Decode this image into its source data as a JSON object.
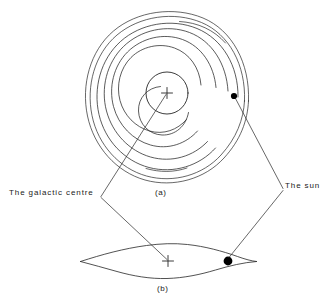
{
  "figure": {
    "type": "astronomy-schematic-diagram",
    "labels": {
      "galactic_centre": "The galactic centre",
      "the_sun": "The sun"
    },
    "captions": {
      "panel_a": "(a)",
      "panel_b": "(b)"
    },
    "colors": {
      "ink": "#262626",
      "background": "#ffffff",
      "marker_fill": "#000000"
    },
    "panel_a": {
      "view": "face-on spiral galaxy",
      "centre_marker": "plus-cross",
      "centre_xy": [
        167,
        93
      ],
      "sun_marker": "filled-dot",
      "sun_xy": [
        234,
        96
      ],
      "bulge_radius": 21,
      "spiral_arm_count": 4,
      "outer_ring_count": 2
    },
    "panel_b": {
      "view": "edge-on galactic disk",
      "centre_marker": "plus-cross",
      "centre_xy": [
        168,
        261
      ],
      "sun_marker": "filled-dot",
      "sun_xy": [
        228,
        261
      ],
      "disk_half_width": 88,
      "disk_half_height": 16
    }
  }
}
